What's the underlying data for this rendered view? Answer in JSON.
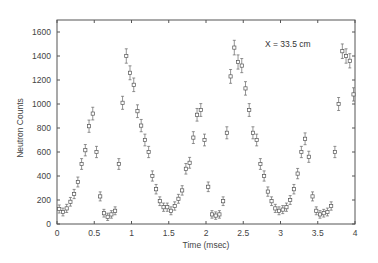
{
  "chart_data": {
    "type": "scatter",
    "title": "",
    "annotation": "X = 33.5 cm",
    "xlabel": "Time (msec)",
    "ylabel": "Neutron Counts",
    "xlim": [
      0,
      4
    ],
    "ylim": [
      0,
      1700
    ],
    "xticks": [
      0,
      0.5,
      1,
      1.5,
      2,
      2.5,
      3,
      3.5,
      4
    ],
    "xtick_labels": [
      "0",
      "0.5",
      "1",
      "1.5",
      "2",
      "2.5",
      "3",
      "3.5",
      "4"
    ],
    "yticks": [
      0,
      200,
      400,
      600,
      800,
      1000,
      1200,
      1400,
      1600
    ],
    "ytick_labels": [
      "0",
      "200",
      "400",
      "600",
      "800",
      "1000",
      "1200",
      "1400",
      "1600"
    ],
    "grid": false,
    "legend": null,
    "marker": "open-square-with-errorbars",
    "series": [
      {
        "name": "Neutron Counts",
        "x": [
          0.03,
          0.08,
          0.13,
          0.18,
          0.23,
          0.28,
          0.33,
          0.38,
          0.43,
          0.48,
          0.53,
          0.58,
          0.63,
          0.68,
          0.73,
          0.78,
          0.83,
          0.88,
          0.93,
          0.98,
          1.03,
          1.08,
          1.13,
          1.18,
          1.23,
          1.28,
          1.33,
          1.38,
          1.43,
          1.48,
          1.53,
          1.58,
          1.63,
          1.68,
          1.73,
          1.78,
          1.83,
          1.88,
          1.93,
          1.98,
          2.03,
          2.08,
          2.13,
          2.18,
          2.23,
          2.28,
          2.33,
          2.38,
          2.43,
          2.48,
          2.53,
          2.58,
          2.63,
          2.68,
          2.73,
          2.78,
          2.83,
          2.88,
          2.93,
          2.98,
          3.03,
          3.08,
          3.13,
          3.18,
          3.23,
          3.28,
          3.33,
          3.38,
          3.43,
          3.48,
          3.53,
          3.58,
          3.63,
          3.68,
          3.73,
          3.78,
          3.83,
          3.88,
          3.93,
          3.98
        ],
        "values": [
          125,
          100,
          130,
          185,
          250,
          350,
          500,
          615,
          815,
          920,
          600,
          230,
          90,
          60,
          80,
          110,
          500,
          1010,
          1400,
          1260,
          1160,
          940,
          820,
          700,
          600,
          400,
          290,
          190,
          140,
          140,
          110,
          150,
          210,
          280,
          460,
          510,
          720,
          910,
          950,
          700,
          310,
          80,
          70,
          80,
          190,
          760,
          1230,
          1470,
          1350,
          1320,
          1130,
          950,
          760,
          700,
          500,
          400,
          270,
          190,
          130,
          110,
          120,
          140,
          200,
          290,
          420,
          600,
          710,
          560,
          230,
          110,
          80,
          90,
          100,
          150,
          600,
          1000,
          1440,
          1400,
          1360,
          1080
        ],
        "error_bars": true
      }
    ]
  }
}
